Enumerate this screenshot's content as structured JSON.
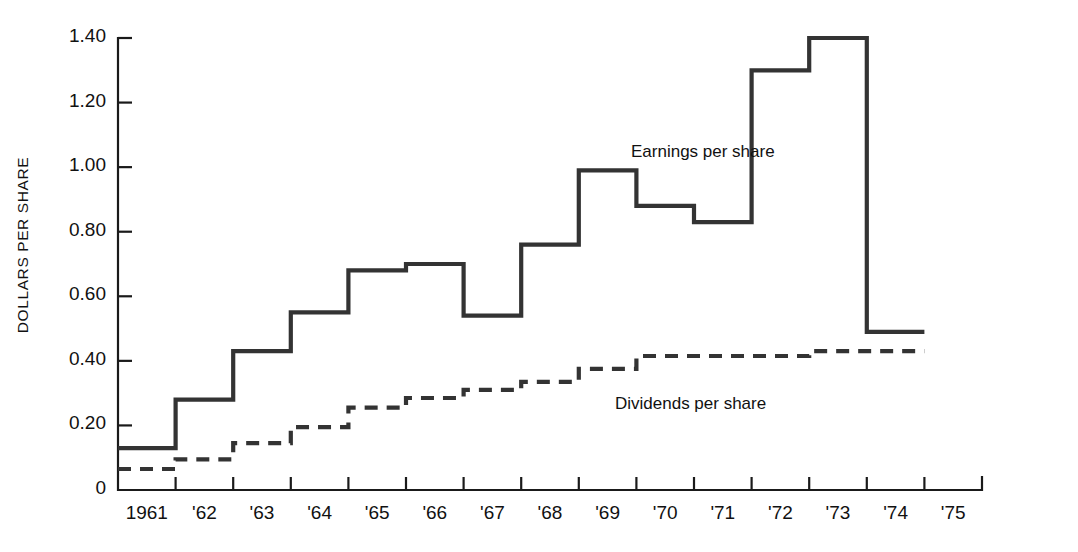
{
  "chart_data": {
    "type": "line",
    "subtype": "step",
    "title": "",
    "xlabel": "",
    "ylabel": "DOLLARS PER SHARE",
    "x_categories": [
      "1961",
      "'62",
      "'63",
      "'64",
      "'65",
      "'66",
      "'67",
      "'68",
      "'69",
      "'70",
      "'71",
      "'72",
      "'73",
      "'74",
      "'75"
    ],
    "x_years": [
      1961,
      1962,
      1963,
      1964,
      1965,
      1966,
      1967,
      1968,
      1969,
      1970,
      1971,
      1972,
      1973,
      1974,
      1975
    ],
    "y_tick_labels": [
      "0",
      "0.20",
      "0.40",
      "0.60",
      "0.80",
      "1.00",
      "1.20",
      "1.40"
    ],
    "y_tick_values": [
      0,
      0.2,
      0.4,
      0.6,
      0.8,
      1.0,
      1.2,
      1.4
    ],
    "ylim": [
      0,
      1.4
    ],
    "grid": false,
    "legend_position": "inline-annotation",
    "series": [
      {
        "name": "Earnings per share",
        "style": "solid",
        "color": "#333333",
        "categories": [
          "1961",
          "'62",
          "'63",
          "'64",
          "'65",
          "'66",
          "'67",
          "'68",
          "'69",
          "'70",
          "'71",
          "'72",
          "'73",
          "'74"
        ],
        "values": [
          0.13,
          0.28,
          0.43,
          0.55,
          0.68,
          0.7,
          0.54,
          0.76,
          0.99,
          0.88,
          0.83,
          1.3,
          1.4,
          0.49
        ]
      },
      {
        "name": "Dividends per share",
        "style": "dashed",
        "color": "#333333",
        "categories": [
          "1961",
          "'62",
          "'63",
          "'64",
          "'65",
          "'66",
          "'67",
          "'68",
          "'69",
          "'70",
          "'71",
          "'72",
          "'73",
          "'74"
        ],
        "values": [
          0.065,
          0.095,
          0.145,
          0.195,
          0.255,
          0.285,
          0.31,
          0.335,
          0.375,
          0.415,
          0.415,
          0.415,
          0.43,
          0.43
        ]
      }
    ],
    "annotations": [
      {
        "text": "Earnings per share",
        "x_px": 631,
        "y_px": 152
      },
      {
        "text": "Dividends per share",
        "x_px": 615,
        "y_px": 404
      }
    ]
  },
  "axis": {
    "y_title": "DOLLARS PER SHARE",
    "y_ticks": [
      {
        "label": "1.40",
        "value": 1.4
      },
      {
        "label": "1.20",
        "value": 1.2
      },
      {
        "label": "1.00",
        "value": 1.0
      },
      {
        "label": "0.80",
        "value": 0.8
      },
      {
        "label": "0.60",
        "value": 0.6
      },
      {
        "label": "0.40",
        "value": 0.4
      },
      {
        "label": "0.20",
        "value": 0.2
      },
      {
        "label": "0",
        "value": 0
      }
    ],
    "x_ticks": [
      {
        "label": "1961"
      },
      {
        "label": "'62"
      },
      {
        "label": "'63"
      },
      {
        "label": "'64"
      },
      {
        "label": "'65"
      },
      {
        "label": "'66"
      },
      {
        "label": "'67"
      },
      {
        "label": "'68"
      },
      {
        "label": "'69"
      },
      {
        "label": "'70"
      },
      {
        "label": "'71"
      },
      {
        "label": "'72"
      },
      {
        "label": "'73"
      },
      {
        "label": "'74"
      },
      {
        "label": "'75"
      }
    ]
  }
}
